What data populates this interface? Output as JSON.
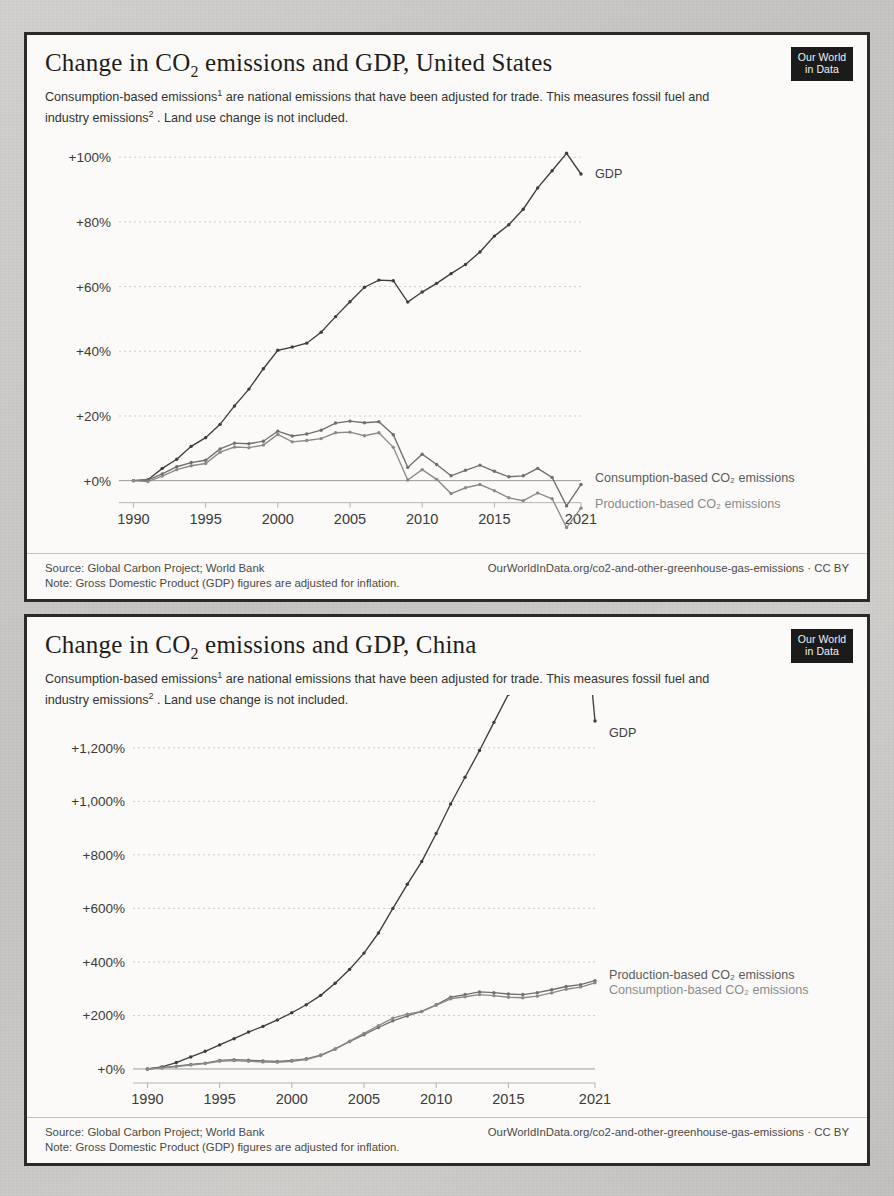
{
  "page": {
    "background_color": "#c9c8c6",
    "panel_color": "#fbfaf8",
    "border_color": "#2a2a2a"
  },
  "logo": {
    "line1": "Our World",
    "line2": "in Data"
  },
  "charts": [
    {
      "id": "us",
      "title_prefix": "Change in CO",
      "title_sub": "2",
      "title_suffix": " emissions and GDP, United States",
      "subtitle_a": "Consumption-based emissions",
      "subtitle_sup_a": "1",
      "subtitle_b": " are national emissions that have been adjusted for trade. This measures fossil fuel and industry emissions",
      "subtitle_sup_b": "2",
      "subtitle_c": " . Land use change is not included.",
      "footer_source": "Source: Global Carbon Project; World Bank",
      "footer_note": "Note: Gross Domestic Product (GDP) figures are adjusted for inflation.",
      "footer_right": "OurWorldInData.org/co2-and-other-greenhouse-gas-emissions · CC BY"
    },
    {
      "id": "cn",
      "title_prefix": "Change in CO",
      "title_sub": "2",
      "title_suffix": " emissions and GDP, China",
      "subtitle_a": "Consumption-based emissions",
      "subtitle_sup_a": "1",
      "subtitle_b": " are national emissions that have been adjusted for trade. This measures fossil fuel and industry emissions",
      "subtitle_sup_b": "2",
      "subtitle_c": " . Land use change is not included.",
      "footer_source": "Source: Global Carbon Project; World Bank",
      "footer_note": "Note: Gross Domestic Product (GDP) figures are adjusted for inflation.",
      "footer_right": "OurWorldInData.org/co2-and-other-greenhouse-gas-emissions · CC BY"
    }
  ],
  "chart_data": [
    {
      "type": "line",
      "id": "us",
      "title": "Change in CO2 emissions and GDP, United States",
      "xlabel": "",
      "ylabel": "",
      "xlim": [
        1989,
        2021
      ],
      "ylim": [
        -10,
        105
      ],
      "grid": true,
      "yticks": [
        0,
        20,
        40,
        60,
        80,
        100
      ],
      "ytick_labels": [
        "+0%",
        "+20%",
        "+40%",
        "+60%",
        "+80%",
        "+100%"
      ],
      "xticks": [
        1990,
        1995,
        2000,
        2005,
        2010,
        2015,
        2021
      ],
      "xtick_labels": [
        "1990",
        "1995",
        "2000",
        "2005",
        "2010",
        "2015",
        "2021"
      ],
      "legend_position": "right-inline",
      "x": [
        1990,
        1991,
        1992,
        1993,
        1994,
        1995,
        1996,
        1997,
        1998,
        1999,
        2000,
        2001,
        2002,
        2003,
        2004,
        2005,
        2006,
        2007,
        2008,
        2009,
        2010,
        2011,
        2012,
        2013,
        2014,
        2015,
        2016,
        2017,
        2018,
        2019,
        2020,
        2021
      ],
      "series": [
        {
          "name": "GDP",
          "color": "#3d3d3d",
          "label_color": "#3d3d3d",
          "values": [
            0,
            0.3,
            3.8,
            6.6,
            10.6,
            13.3,
            17.4,
            23.1,
            28.3,
            34.6,
            40.3,
            41.3,
            42.5,
            45.9,
            50.7,
            55.3,
            59.8,
            62.0,
            61.8,
            55.2,
            58.3,
            61.0,
            64.0,
            66.8,
            70.7,
            75.6,
            79.1,
            83.9,
            90.5,
            95.8,
            101.2,
            94.8
          ]
        },
        {
          "name": "Consumption-based CO₂ emissions",
          "color": "#6f6f6f",
          "label_color": "#5a5a58",
          "values": [
            0,
            0.2,
            2.1,
            4.3,
            5.6,
            6.3,
            9.8,
            11.6,
            11.4,
            12.2,
            15.3,
            13.8,
            14.4,
            15.6,
            17.8,
            18.4,
            17.9,
            18.2,
            14.2,
            4.1,
            8.2,
            5.0,
            1.5,
            3.2,
            4.8,
            2.9,
            1.2,
            1.5,
            3.8,
            1.0,
            -7.8,
            -1.2
          ]
        },
        {
          "name": "Production-based CO₂ emissions",
          "color": "#8a8a8a",
          "label_color": "#8a8a8a",
          "values": [
            0,
            -0.3,
            1.4,
            3.4,
            4.6,
            5.3,
            8.8,
            10.4,
            10.2,
            11.0,
            14.3,
            12.0,
            12.4,
            13.0,
            14.8,
            15.0,
            13.9,
            14.8,
            10.3,
            0.2,
            3.4,
            0.4,
            -4.0,
            -2.2,
            -1.2,
            -3.1,
            -5.3,
            -6.2,
            -3.8,
            -5.6,
            -14.5,
            -8.5
          ]
        }
      ],
      "annotations": [
        {
          "text": "GDP",
          "x": 2021,
          "y": 95
        },
        {
          "text": "Consumption-based CO₂ emissions",
          "x": 2021,
          "y": 1
        },
        {
          "text": "Production-based CO₂ emissions",
          "x": 2021,
          "y": -7
        }
      ]
    },
    {
      "type": "line",
      "id": "cn",
      "title": "Change in CO2 emissions and GDP, China",
      "xlabel": "",
      "ylabel": "",
      "xlim": [
        1989,
        2021
      ],
      "ylim": [
        -30,
        1330
      ],
      "grid": true,
      "yticks": [
        0,
        200,
        400,
        600,
        800,
        1000,
        1200
      ],
      "ytick_labels": [
        "+0%",
        "+200%",
        "+400%",
        "+600%",
        "+800%",
        "+1,000%",
        "+1,200%"
      ],
      "xticks": [
        1990,
        1995,
        2000,
        2005,
        2010,
        2015,
        2021
      ],
      "xtick_labels": [
        "1990",
        "1995",
        "2000",
        "2005",
        "2010",
        "2015",
        "2021"
      ],
      "legend_position": "right-inline",
      "x": [
        1990,
        1991,
        1992,
        1993,
        1994,
        1995,
        1996,
        1997,
        1998,
        1999,
        2000,
        2001,
        2002,
        2003,
        2004,
        2005,
        2006,
        2007,
        2008,
        2009,
        2010,
        2011,
        2012,
        2013,
        2014,
        2015,
        2016,
        2017,
        2018,
        2019,
        2020,
        2021
      ],
      "series": [
        {
          "name": "GDP",
          "color": "#3d3d3d",
          "label_color": "#3d3d3d",
          "values": [
            0,
            8,
            24,
            45,
            66,
            90,
            113,
            138,
            159,
            183,
            210,
            240,
            275,
            320,
            372,
            433,
            508,
            600,
            690,
            775,
            880,
            990,
            1090,
            1190,
            1295,
            1400,
            1510,
            1630,
            1740,
            1840,
            1880,
            1300
          ]
        },
        {
          "name": "Production-based CO₂ emissions",
          "color": "#6f6f6f",
          "label_color": "#5a5a58",
          "values": [
            0,
            5,
            10,
            17,
            22,
            32,
            35,
            33,
            30,
            28,
            32,
            38,
            52,
            75,
            102,
            128,
            155,
            180,
            198,
            215,
            240,
            268,
            278,
            288,
            285,
            280,
            278,
            285,
            296,
            308,
            315,
            330
          ]
        },
        {
          "name": "Consumption-based CO₂ emissions",
          "color": "#8a8a8a",
          "label_color": "#8a8a8a",
          "values": [
            0,
            4,
            9,
            15,
            20,
            29,
            31,
            29,
            26,
            25,
            29,
            35,
            50,
            74,
            104,
            133,
            162,
            190,
            205,
            215,
            238,
            262,
            270,
            278,
            274,
            268,
            266,
            272,
            284,
            298,
            306,
            322
          ]
        }
      ],
      "annotations": [
        {
          "text": "GDP",
          "x": 2021,
          "y": 1260
        },
        {
          "text": "Production-based CO₂ emissions",
          "x": 2021,
          "y": 355
        },
        {
          "text": "Consumption-based CO₂ emissions",
          "x": 2021,
          "y": 300
        }
      ]
    }
  ]
}
